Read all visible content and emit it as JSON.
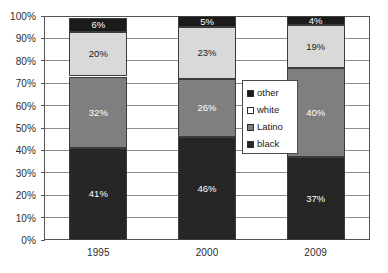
{
  "chart_data": {
    "type": "bar",
    "subtype": "stacked-bar-100-percent",
    "title": "",
    "subtitle": "",
    "xlabel": "",
    "ylabel": "",
    "categories": [
      "1995",
      "2000",
      "2009"
    ],
    "ylim": [
      0,
      100
    ],
    "y_tick_labels": [
      "0%",
      "10%",
      "20%",
      "30%",
      "40%",
      "50%",
      "60%",
      "70%",
      "80%",
      "90%",
      "100%"
    ],
    "y_ticks": [
      0,
      10,
      20,
      30,
      40,
      50,
      60,
      70,
      80,
      90,
      100
    ],
    "grid": true,
    "grid_axis": "y",
    "legend_position": "center-right-inside",
    "stack_order_bottom_to_top": [
      "black",
      "Latino",
      "white",
      "other"
    ],
    "series": [
      {
        "name": "black",
        "color": "#262626",
        "values": [
          41,
          46,
          37
        ],
        "data_labels": [
          "41%",
          "46%",
          "37%"
        ],
        "label_color": "#ffffff"
      },
      {
        "name": "Latino",
        "color": "#7f7f7f",
        "values": [
          32,
          26,
          40
        ],
        "data_labels": [
          "32%",
          "26%",
          "40%"
        ],
        "label_color": "#ffffff"
      },
      {
        "name": "white",
        "color": "#d9d9d9",
        "values": [
          20,
          23,
          19
        ],
        "data_labels": [
          "20%",
          "23%",
          "19%"
        ],
        "label_color": "#1a1a1a"
      },
      {
        "name": "other",
        "color": "#1a1a1a",
        "values": [
          6,
          5,
          4
        ],
        "data_labels": [
          "6%",
          "5%",
          "4%"
        ],
        "label_color": "#ffffff"
      }
    ]
  },
  "legend": {
    "entries": [
      {
        "label": "other",
        "color": "#1a1a1a"
      },
      {
        "label": "white",
        "color": "#ffffff"
      },
      {
        "label": "Latino",
        "color": "#7f7f7f"
      },
      {
        "label": "black",
        "color": "#262626"
      }
    ]
  },
  "colors": {
    "plot_border": "#555555",
    "gridline": "#8c8c8c",
    "segment_border": "#3d3d3d",
    "axis_text": "#2b2b2b",
    "background": "#ffffff"
  }
}
